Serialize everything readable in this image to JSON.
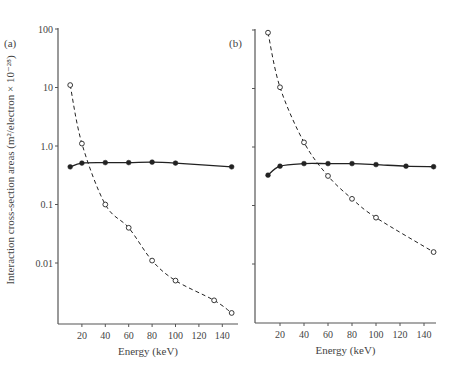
{
  "chart_data": [
    {
      "type": "line",
      "panel_label": "(a)",
      "xlabel": "Energy (keV)",
      "ylabel": "Interaction cross-section areas (m²/electron × 10⁻²⁸)",
      "yscale": "log",
      "ylim": [
        0.001,
        100
      ],
      "xlim": [
        0,
        150
      ],
      "xticks": [
        20,
        40,
        60,
        80,
        100,
        120,
        140
      ],
      "yticks": [
        100,
        10,
        1.0,
        0.1,
        0.01
      ],
      "ytick_labels": [
        "100",
        "10",
        "1.0",
        "0.1",
        "0.01"
      ],
      "grid": false,
      "legend": null,
      "series": [
        {
          "name": "open-circles-dashed",
          "marker": "open-circle",
          "line": "dashed",
          "x": [
            10,
            20,
            40,
            60,
            80,
            100,
            133,
            148
          ],
          "y": [
            11,
            1.1,
            0.1,
            0.04,
            0.011,
            0.005,
            0.0023,
            0.0014
          ]
        },
        {
          "name": "filled-circles-solid",
          "marker": "filled-circle",
          "line": "solid",
          "x": [
            10,
            20,
            40,
            60,
            80,
            100,
            148
          ],
          "y": [
            0.44,
            0.51,
            0.52,
            0.52,
            0.53,
            0.51,
            0.44
          ]
        }
      ]
    },
    {
      "type": "line",
      "panel_label": "(b)",
      "xlabel": "Energy (keV)",
      "ylabel": "",
      "yscale": "log",
      "ylim": [
        0.001,
        100
      ],
      "xlim": [
        0,
        150
      ],
      "xticks": [
        20,
        40,
        60,
        80,
        100,
        120,
        140
      ],
      "yticks": [
        100,
        10,
        1.0,
        0.1,
        0.01
      ],
      "ytick_labels": [],
      "grid": false,
      "legend": null,
      "series": [
        {
          "name": "open-circles-dashed",
          "marker": "open-circle",
          "line": "dashed",
          "x": [
            10,
            20,
            40,
            60,
            80,
            100,
            148
          ],
          "y": [
            90,
            10.5,
            1.2,
            0.32,
            0.13,
            0.062,
            0.016
          ]
        },
        {
          "name": "filled-circles-solid",
          "marker": "filled-circle",
          "line": "solid",
          "x": [
            10,
            20,
            40,
            60,
            80,
            100,
            125,
            148
          ],
          "y": [
            0.33,
            0.47,
            0.52,
            0.52,
            0.52,
            0.5,
            0.47,
            0.46
          ]
        }
      ]
    }
  ],
  "figure": {
    "ylabel": "Interaction cross-section areas (m²/electron × 10⁻²⁸)",
    "panels": [
      {
        "label": "(a)",
        "xlabel": "Energy (keV)",
        "xtick_labels": [
          "20",
          "40",
          "60",
          "80",
          "100",
          "120",
          "140"
        ],
        "ytick_labels": [
          "100",
          "10",
          "1.0",
          "0.1",
          "0.01"
        ]
      },
      {
        "label": "(b)",
        "xlabel": "Energy (keV)",
        "xtick_labels": [
          "20",
          "40",
          "60",
          "80",
          "100",
          "120",
          "140"
        ],
        "ytick_labels": []
      }
    ]
  },
  "style": {
    "ink": "#222222",
    "axis": "#555555",
    "text": "#444444"
  }
}
